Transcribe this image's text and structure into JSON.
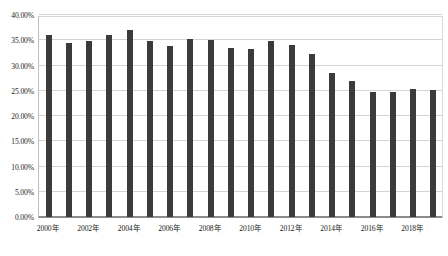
{
  "chart_data": {
    "type": "bar",
    "title": "",
    "xlabel": "",
    "ylabel": "",
    "ylim": [
      0,
      40
    ],
    "grid": true,
    "legend": "none",
    "y_unit": "%",
    "categories": [
      "2000年",
      "2001年",
      "2002年",
      "2003年",
      "2004年",
      "2005年",
      "2006年",
      "2007年",
      "2008年",
      "2009年",
      "2010年",
      "2011年",
      "2012年",
      "2013年",
      "2014年",
      "2015年",
      "2016年",
      "2017年",
      "2018年",
      "2019年"
    ],
    "values": [
      36.0,
      34.4,
      34.8,
      36.0,
      37.1,
      34.8,
      33.9,
      35.3,
      35.1,
      33.4,
      33.3,
      34.8,
      34.0,
      32.3,
      28.6,
      27.0,
      24.8,
      24.8,
      25.4,
      25.2
    ],
    "value_labels": [
      "36.00%",
      "34.40%",
      "34.80%",
      "36.00%",
      "37.10%",
      "34.80%",
      "33.90%",
      "35.30%",
      "35.10%",
      "33.40%",
      "33.30%",
      "34.80%",
      "34.00%",
      "32.30%",
      "28.60%",
      "27.00%",
      "24.80%",
      "24.80%",
      "25.40%",
      "25.20%"
    ],
    "y_ticks": [
      {
        "value": 40,
        "label": "40.00%"
      },
      {
        "value": 35,
        "label": "35.00%"
      },
      {
        "value": 30,
        "label": "30.00%"
      },
      {
        "value": 25,
        "label": "25.00%"
      },
      {
        "value": 20,
        "label": "20.00%"
      },
      {
        "value": 15,
        "label": "15.00%"
      },
      {
        "value": 10,
        "label": "10.00%"
      },
      {
        "value": 5,
        "label": "5.00%"
      },
      {
        "value": 0,
        "label": "0.00%"
      }
    ],
    "x_ticks": [
      {
        "index": 0,
        "label": "2000年"
      },
      {
        "index": 2,
        "label": "2002年"
      },
      {
        "index": 4,
        "label": "2004年"
      },
      {
        "index": 6,
        "label": "2006年"
      },
      {
        "index": 8,
        "label": "2008年"
      },
      {
        "index": 10,
        "label": "2010年"
      },
      {
        "index": 12,
        "label": "2012年"
      },
      {
        "index": 14,
        "label": "2014年"
      },
      {
        "index": 16,
        "label": "2016年"
      },
      {
        "index": 18,
        "label": "2018年"
      }
    ],
    "colors": {
      "bar": "#3b3b3b",
      "grid": "#d4d4d4",
      "axis": "#8c8c8c",
      "text": "#1a1a1a",
      "background": "#ffffff"
    }
  }
}
